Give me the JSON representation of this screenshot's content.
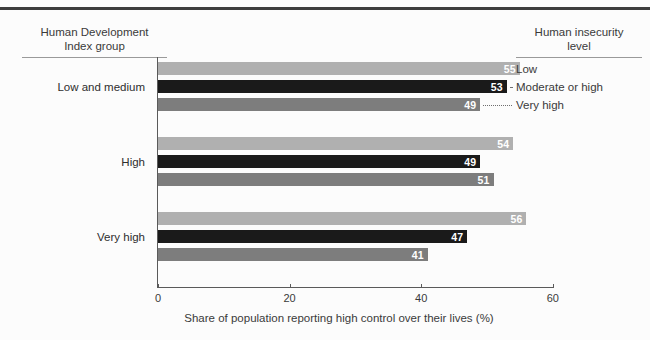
{
  "headers": {
    "left": "Human Development\nIndex group",
    "left_line1": "Human Development",
    "left_line2": "Index group",
    "right_line1": "Human insecurity",
    "right_line2": "level"
  },
  "legend": {
    "items": [
      {
        "label": "Low",
        "color": "#b0b0b0"
      },
      {
        "label": "Moderate or high",
        "color": "#1a1a1a"
      },
      {
        "label": "Very high",
        "color": "#7d7d7d"
      }
    ]
  },
  "axis": {
    "ticks": [
      "0",
      "20",
      "40",
      "60"
    ],
    "title": "Share of population reporting high control over their lives (%)"
  },
  "chart_data": {
    "type": "bar",
    "orientation": "horizontal",
    "title": "",
    "xlabel": "Share of population reporting high control over their lives (%)",
    "ylabel": "Human Development Index group",
    "xlim": [
      0,
      60
    ],
    "xticks": [
      0,
      20,
      40,
      60
    ],
    "grid": false,
    "legend_title": "Human insecurity level",
    "legend_position": "right",
    "categories": [
      "Low and medium",
      "High",
      "Very high"
    ],
    "series": [
      {
        "name": "Low",
        "color": "#b0b0b0",
        "values": [
          55,
          54,
          56
        ]
      },
      {
        "name": "Moderate or high",
        "color": "#1a1a1a",
        "values": [
          53,
          49,
          47
        ]
      },
      {
        "name": "Very high",
        "color": "#7d7d7d",
        "values": [
          49,
          51,
          41
        ]
      }
    ],
    "bars": [
      {
        "category": "Low and medium",
        "series": "Low",
        "value": 55
      },
      {
        "category": "Low and medium",
        "series": "Moderate or high",
        "value": 53
      },
      {
        "category": "Low and medium",
        "series": "Very high",
        "value": 49
      },
      {
        "category": "High",
        "series": "Low",
        "value": 54
      },
      {
        "category": "High",
        "series": "Moderate or high",
        "value": 49
      },
      {
        "category": "High",
        "series": "Very high",
        "value": 51
      },
      {
        "category": "Very high",
        "series": "Low",
        "value": 56
      },
      {
        "category": "Very high",
        "series": "Moderate or high",
        "value": 47
      },
      {
        "category": "Very high",
        "series": "Very high",
        "value": 41
      }
    ]
  }
}
